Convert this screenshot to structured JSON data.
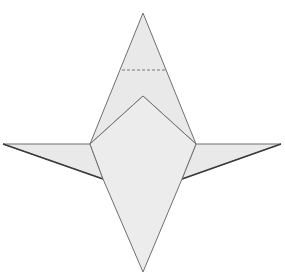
{
  "diagram": {
    "title": "",
    "type": "origami-fold-diagram",
    "colors": {
      "background": "#ffffff",
      "paper_fill": "#e9e9e9",
      "paper_fill_front": "#ececec",
      "edge_stroke": "#6f6f6f",
      "shadow_stroke": "#3a3a3a",
      "fold_line": "#777777"
    },
    "shapes": {
      "top_flap": "143,13 90,144 143,96 196,144",
      "body_front": "90,144 143,96 196,144 182,179 143,272 103,179",
      "left_wing": "3,144 90,144 103,179",
      "right_wing": "281,144 196,144 182,179",
      "left_wing_shadow": "3,144 103,179",
      "right_wing_shadow": "281,144 182,179",
      "fold_line": {
        "x1": 122,
        "y1": 70,
        "x2": 166,
        "y2": 70,
        "style": "dashed"
      }
    },
    "annotations": []
  }
}
